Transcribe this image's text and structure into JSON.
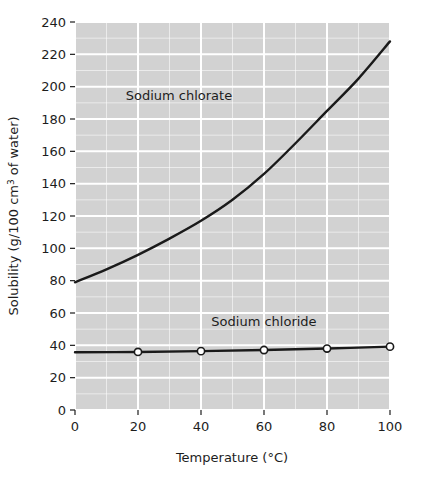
{
  "chart_data": {
    "type": "line",
    "title": "",
    "xlabel": "Temperature (°C)",
    "ylabel": "Solubility (g/100 cm³ of water)",
    "xlim": [
      0,
      100
    ],
    "ylim": [
      0,
      240
    ],
    "xticks": [
      0,
      20,
      40,
      60,
      80,
      100
    ],
    "yticks": [
      0,
      20,
      40,
      60,
      80,
      100,
      120,
      140,
      160,
      180,
      200,
      220,
      240
    ],
    "xtick_labels": [
      "0",
      "20",
      "40",
      "60",
      "80",
      "100"
    ],
    "ytick_labels": [
      "0",
      "20",
      "40",
      "60",
      "80",
      "100",
      "120",
      "140",
      "160",
      "180",
      "200",
      "220",
      "240"
    ],
    "minor_gridline_step_x": 10,
    "minor_gridline_step_y": 10,
    "grid": true,
    "grid_color": "#ffffff",
    "plot_background": "#d2d2d2",
    "figure_background": "#ffffff",
    "legend": "inline-labels",
    "series": [
      {
        "name": "Sodium chlorate",
        "label_text": "Sodium chlorate",
        "color": "#1a1a1a",
        "markers": false,
        "x": [
          0,
          10,
          20,
          30,
          40,
          50,
          60,
          70,
          80,
          90,
          100
        ],
        "values": [
          79,
          87,
          96,
          106,
          117,
          130,
          146,
          165,
          185,
          205,
          228
        ]
      },
      {
        "name": "Sodium chloride",
        "label_text": "Sodium chloride",
        "color": "#1a1a1a",
        "markers": true,
        "marker_style": "open-circle",
        "x": [
          0,
          20,
          40,
          60,
          80,
          100
        ],
        "values": [
          35.7,
          35.9,
          36.4,
          37.1,
          38.0,
          39.2
        ]
      }
    ],
    "annotations": [
      {
        "text": "Sodium chlorate",
        "x": 33,
        "y": 192
      },
      {
        "text": "Sodium chloride",
        "x": 60,
        "y": 52
      }
    ]
  },
  "axes": {
    "y_title": "Solubility (g/100 cm³ of water)",
    "x_title": "Temperature (°C)"
  },
  "caption": {
    "partial_text": ""
  }
}
